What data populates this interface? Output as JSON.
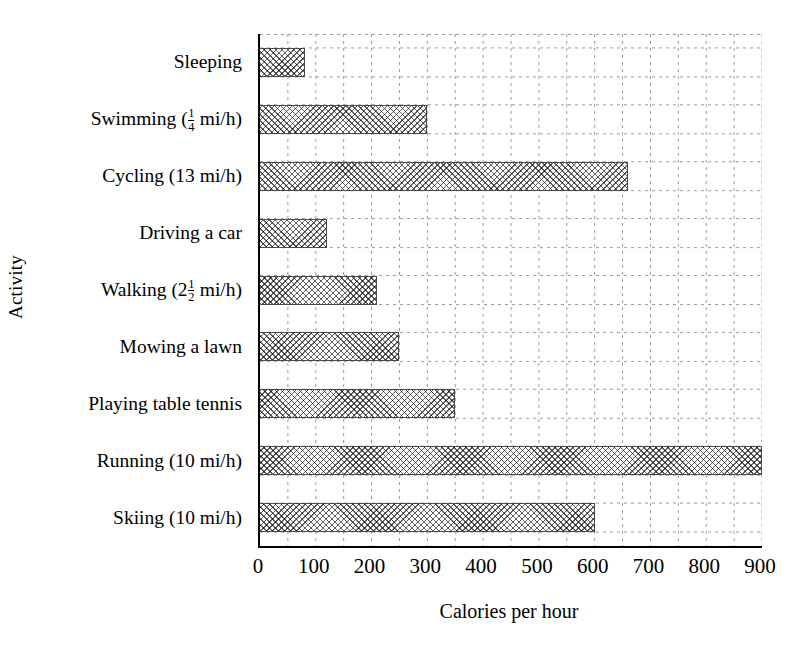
{
  "chart_data": {
    "type": "bar",
    "orientation": "horizontal",
    "title": "",
    "xlabel": "Calories per hour",
    "ylabel": "Activity",
    "categories": [
      "Sleeping",
      "Swimming (1/4 mi/h)",
      "Cycling (13 mi/h)",
      "Driving a car",
      "Walking (2 1/2 mi/h)",
      "Mowing a lawn",
      "Playing table tennis",
      "Running (10 mi/h)",
      "Skiing (10 mi/h)"
    ],
    "values": [
      80,
      300,
      660,
      120,
      210,
      250,
      350,
      900,
      600
    ],
    "xlim": [
      0,
      900
    ],
    "xticks": [
      0,
      100,
      200,
      300,
      400,
      500,
      600,
      700,
      800,
      900
    ],
    "xtick_labels": [
      "0",
      "100",
      "200",
      "300",
      "400",
      "500",
      "600",
      "700",
      "800",
      "900"
    ],
    "grid": true,
    "grid_style": "dashed",
    "grid_minor_step": 50,
    "legend": null,
    "bar_fill": "crosshatch",
    "colors": {
      "axis": "#000000",
      "grid": "#9a9a9a",
      "bar_edge": "#4a4a4a",
      "bar_face": "#ffffff",
      "background": "#ffffff"
    }
  },
  "categories_rich": [
    {
      "prefix": "Sleeping",
      "num": "",
      "den": "",
      "suffix": ""
    },
    {
      "prefix": "Swimming (",
      "num": "1",
      "den": "4",
      "suffix": " mi/h)"
    },
    {
      "prefix": "Cycling (13 mi/h)",
      "num": "",
      "den": "",
      "suffix": ""
    },
    {
      "prefix": "Driving a car",
      "num": "",
      "den": "",
      "suffix": ""
    },
    {
      "prefix": "Walking (2",
      "num": "1",
      "den": "2",
      "suffix": " mi/h)"
    },
    {
      "prefix": "Mowing a lawn",
      "num": "",
      "den": "",
      "suffix": ""
    },
    {
      "prefix": "Playing table tennis",
      "num": "",
      "den": "",
      "suffix": ""
    },
    {
      "prefix": "Running (10 mi/h)",
      "num": "",
      "den": "",
      "suffix": ""
    },
    {
      "prefix": "Skiing (10 mi/h)",
      "num": "",
      "den": "",
      "suffix": ""
    }
  ]
}
